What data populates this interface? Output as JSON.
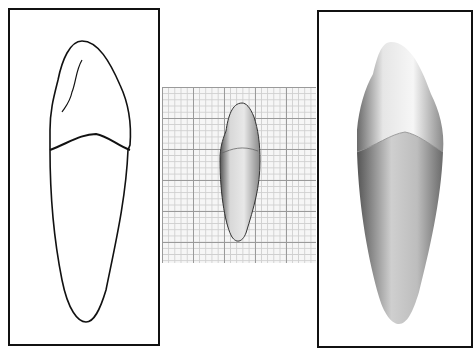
{
  "figure": {
    "panels": [
      {
        "id": "left",
        "kind": "line-drawing",
        "subject": "tooth outline (crown and root with cemento-enamel junction)"
      },
      {
        "id": "center",
        "kind": "photograph",
        "subject": "tooth on millimeter graph paper"
      },
      {
        "id": "right",
        "kind": "shaded-render",
        "subject": "tooth 3D shaded illustration"
      }
    ],
    "colors": {
      "ink": "#111111",
      "paper": "#ffffff",
      "grid_major": "#9a9a9a",
      "grid_minor": "#cfcfcf"
    }
  }
}
